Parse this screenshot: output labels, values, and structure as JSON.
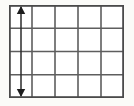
{
  "figure": {
    "background_color": "#fbfbf8"
  },
  "chart_data": {
    "type": "diagram",
    "title": "",
    "subtitle": "",
    "xlabel": "",
    "ylabel": "",
    "grid": true,
    "legend_position": "none",
    "annotations": [
      {
        "name": "vertical-double-arrow",
        "kind": "double-headed-arrow",
        "orientation": "vertical",
        "label": "",
        "spans_rows": 4,
        "located_in_column": 1,
        "from": {
          "x": 12,
          "y": 1
        },
        "to": {
          "x": 12,
          "y": 92
        }
      }
    ]
  },
  "grid": {
    "columns": 5,
    "rows": 4,
    "cell_width": 23,
    "cell_height": 23,
    "total_width": 115,
    "total_height": 93,
    "line_color": "#5e5e5e",
    "frame_color": "#4a4a4a",
    "cell_fill": "#ffffff",
    "x_positions": [
      0,
      23,
      46,
      69,
      92,
      115
    ],
    "y_positions": [
      0,
      23.25,
      46.5,
      69.75,
      93
    ]
  },
  "arrow": {
    "color": "#1d1d1d",
    "shaft_x": 12,
    "top_y": 1,
    "bottom_y": 92,
    "head_half_width": 4.2,
    "head_length": 8,
    "shaft_width": 1.5,
    "label": ""
  }
}
